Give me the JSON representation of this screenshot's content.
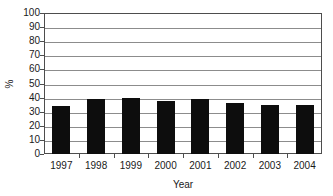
{
  "chart_data": {
    "type": "bar",
    "title": "",
    "subtitle": "",
    "xlabel": "Year",
    "ylabel": "%",
    "categories": [
      "1997",
      "1998",
      "1999",
      "2000",
      "2001",
      "2002",
      "2003",
      "2004"
    ],
    "values": [
      34,
      39,
      39.5,
      37.5,
      39,
      36.5,
      35,
      35
    ],
    "series": [
      {
        "name": "",
        "values": [
          34,
          39,
          39.5,
          37.5,
          39,
          36.5,
          35,
          35
        ]
      }
    ],
    "ylim": [
      0,
      100
    ],
    "ytick_labels": [
      "0",
      "10",
      "20",
      "30",
      "40",
      "50",
      "60",
      "70",
      "80",
      "90",
      "100"
    ],
    "ytick_values": [
      0,
      10,
      20,
      30,
      40,
      50,
      60,
      70,
      80,
      90,
      100
    ],
    "xtick_labels": [
      "1997",
      "1998",
      "1999",
      "2000",
      "2001",
      "2002",
      "2003",
      "2004"
    ],
    "grid": "horizontal",
    "legend": "none",
    "annotations": [],
    "colors": {
      "bar": "#0d0d0d",
      "gridline": "#8c8c8c",
      "frame": "#4d4d4d",
      "background": "#ffffff",
      "text": "#1a1a1a"
    }
  }
}
